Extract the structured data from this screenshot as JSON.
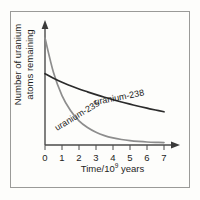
{
  "figure": {
    "border_color": "#9a9a98",
    "background": "#fdfdfb"
  },
  "axes": {
    "x_title_main": "Time/10",
    "x_title_exponent": "9",
    "x_title_tail": " years",
    "y_title_line1": "Number of uranium",
    "y_title_line2": "atoms remaining",
    "x_ticks": [
      "0",
      "1",
      "2",
      "3",
      "4",
      "5",
      "6",
      "7"
    ],
    "x_arrow": "axis-arrow-right",
    "y_arrow": "axis-arrow-up"
  },
  "chart_data": {
    "type": "line",
    "title": "",
    "xlabel": "Time/10^9 years",
    "ylabel": "Number of uranium atoms remaining",
    "xlim": [
      0,
      7
    ],
    "ylim": [
      0,
      1
    ],
    "grid": false,
    "legend": "inline-curve-labels",
    "x": [
      0,
      0.5,
      1,
      1.5,
      2,
      2.5,
      3,
      3.5,
      4,
      4.5,
      5,
      5.5,
      6,
      6.5,
      7
    ],
    "series": [
      {
        "name": "uranium-238",
        "color": "#2b2b2b",
        "label_text": "uranium-238",
        "values": [
          0.62,
          0.58,
          0.545,
          0.515,
          0.487,
          0.462,
          0.438,
          0.415,
          0.394,
          0.374,
          0.355,
          0.337,
          0.32,
          0.304,
          0.289
        ]
      },
      {
        "name": "uranium-235",
        "color": "#8d8d8d",
        "label_text": "uranium-235",
        "values": [
          0.93,
          0.63,
          0.43,
          0.3,
          0.21,
          0.152,
          0.111,
          0.082,
          0.062,
          0.048,
          0.038,
          0.031,
          0.026,
          0.023,
          0.021
        ]
      }
    ]
  }
}
